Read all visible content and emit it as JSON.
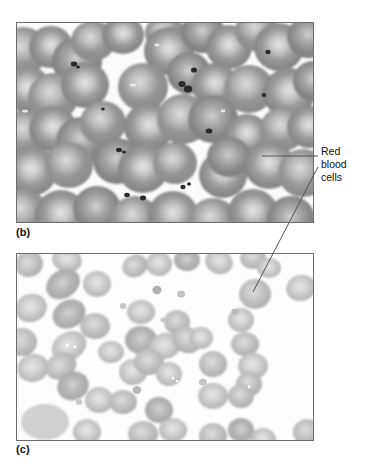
{
  "figure": {
    "background_color": "#ffffff",
    "line_color": "#555555",
    "border_color": "#6e6e6e"
  },
  "panels": [
    {
      "id": "b",
      "caption": "(b)",
      "description": "Light micrograph of a blood smear showing densely packed red blood cells with pale central pallor and scattered dark platelets",
      "cell_fill": "#8f8f8f",
      "cell_center": "#d8d8d8",
      "background": "#fbfbfa",
      "bounds": {
        "x": 16,
        "y": 22,
        "width": 296,
        "height": 199
      }
    },
    {
      "id": "c",
      "caption": "(c)",
      "description": "Light micrograph of a blood smear showing sparser, paler, more oval red blood cells",
      "cell_fill": "#bcbcbc",
      "cell_center": "#dedede",
      "background": "#fdfdfd",
      "bounds": {
        "x": 16,
        "y": 253,
        "width": 296,
        "height": 186
      }
    }
  ],
  "annotations": [
    {
      "id": "red-blood-cells",
      "lines": [
        "Red",
        "blood",
        "cells"
      ],
      "text": "Red blood cells",
      "position": {
        "x": 321,
        "y": 145
      },
      "leaders": [
        {
          "target_panel": "b",
          "from": [
            318,
            156
          ],
          "to": [
            262,
            156
          ]
        },
        {
          "target_panel": "c",
          "from": [
            318,
            167
          ],
          "to": [
            253,
            292
          ]
        }
      ]
    }
  ]
}
